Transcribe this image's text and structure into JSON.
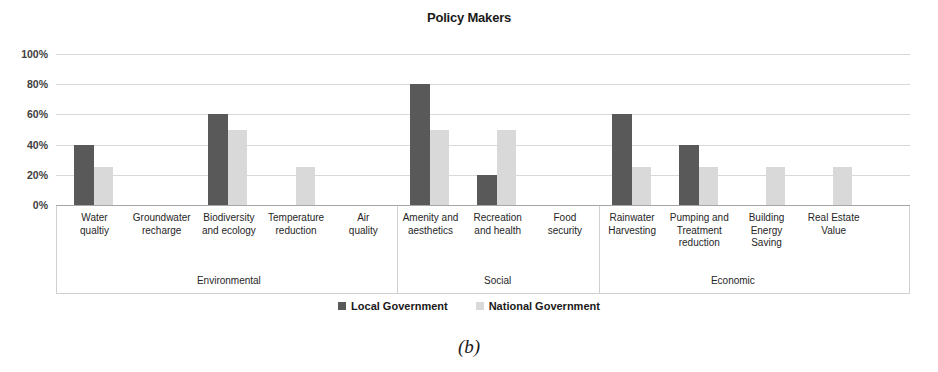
{
  "chart_data": {
    "type": "bar",
    "title": "Policy Makers",
    "caption": "(b)",
    "xlabel": "",
    "ylabel": "",
    "ylim": [
      0,
      100
    ],
    "ytick_labels": [
      "100%",
      "80%",
      "60%",
      "40%",
      "20%",
      "0%"
    ],
    "ytick_values": [
      100,
      80,
      60,
      40,
      20,
      0
    ],
    "grid": true,
    "legend_position": "bottom",
    "colors": {
      "local_government": "#595959",
      "national_government": "#D9D9D9",
      "gridline": "#D9D9D9",
      "axis": "#A6A6A6"
    },
    "categories": [
      "Water qualtiy",
      "Groundwater recharge",
      "Biodiversity and ecology",
      "Temperature reduction",
      "Air quality",
      "Amenity and aesthetics",
      "Recreation and health",
      "Food security",
      "Rainwater Harvesting",
      "Pumping and Treatment reduction",
      "Building Energy Saving",
      "Real Estate Value"
    ],
    "series": [
      {
        "name": "Local Government",
        "color": "#595959",
        "values": [
          40,
          0,
          60,
          0,
          0,
          80,
          20,
          0,
          60,
          40,
          0,
          0
        ]
      },
      {
        "name": "National Government",
        "color": "#D9D9D9",
        "values": [
          25,
          0,
          50,
          25,
          0,
          50,
          50,
          0,
          25,
          25,
          25,
          25
        ]
      }
    ],
    "groups": [
      {
        "label": "Environmental",
        "categories": [
          "Water qualtiy",
          "Groundwater recharge",
          "Biodiversity and ecology",
          "Temperature reduction",
          "Air quality"
        ]
      },
      {
        "label": "Social",
        "categories": [
          "Amenity and aesthetics",
          "Recreation and health",
          "Food security"
        ]
      },
      {
        "label": "Economic",
        "categories": [
          "Rainwater Harvesting",
          "Pumping and Treatment reduction",
          "Building Energy Saving",
          "Real Estate Value"
        ]
      }
    ],
    "category_lines": [
      [
        "Water",
        "qualtiy"
      ],
      [
        "Groundwater",
        "recharge"
      ],
      [
        "Biodiversity",
        "and ecology"
      ],
      [
        "Temperature",
        "reduction"
      ],
      [
        "Air",
        "quality"
      ],
      [
        "Amenity and",
        "aesthetics"
      ],
      [
        "Recreation",
        "and health"
      ],
      [
        "Food",
        "security"
      ],
      [
        "Rainwater",
        "Harvesting"
      ],
      [
        "Pumping and",
        "Treatment",
        "reduction"
      ],
      [
        "Building",
        "Energy",
        "Saving"
      ],
      [
        "Real Estate",
        "Value"
      ]
    ]
  }
}
